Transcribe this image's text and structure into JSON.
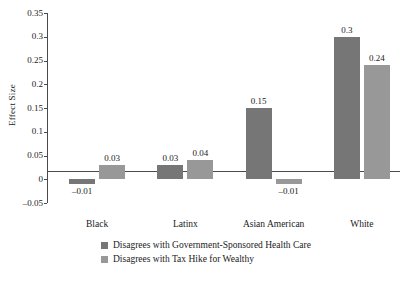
{
  "chart_data": {
    "type": "bar",
    "title": "",
    "xlabel": "",
    "ylabel": "Effect Size",
    "ylim": [
      -0.05,
      0.35
    ],
    "ytick_labels": [
      "0.35",
      "0.3",
      "0.25",
      "0.2",
      "0.15",
      "0.1",
      "0.05",
      "0",
      "–0.05"
    ],
    "ytick_values": [
      0.35,
      0.3,
      0.25,
      0.2,
      0.15,
      0.1,
      0.05,
      0,
      -0.05
    ],
    "grid": false,
    "legend_position": "bottom-center",
    "categories": [
      "Black",
      "Latinx",
      "Asian American",
      "White"
    ],
    "series": [
      {
        "name": "Disagrees with Government-Sponsored Health Care",
        "color": "#767676",
        "values": [
          -0.01,
          0.03,
          0.15,
          0.3
        ],
        "labels": [
          "–0.01",
          "0.03",
          "0.15",
          "0.3"
        ]
      },
      {
        "name": "Disagrees with Tax Hike for Wealthy",
        "color": "#989898",
        "values": [
          0.03,
          0.04,
          -0.01,
          0.24
        ],
        "labels": [
          "0.03",
          "0.04",
          "–0.01",
          "0.24"
        ]
      }
    ]
  }
}
